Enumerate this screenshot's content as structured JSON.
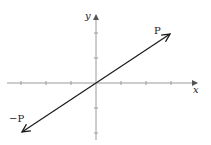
{
  "diagram": {
    "type": "vector-plot",
    "axes": {
      "x_label": "x",
      "y_label": "y",
      "origin_px": [
        96,
        83
      ],
      "tick_spacing_px": 25,
      "x_ticks": [
        -3,
        -2,
        -1,
        1,
        2,
        3
      ],
      "y_ticks": [
        -2,
        -1,
        1,
        2
      ]
    },
    "vectors": [
      {
        "name": "P",
        "label": "P",
        "from": [
          0,
          0
        ],
        "to": [
          3,
          2
        ]
      },
      {
        "name": "neg-P",
        "label": "−P",
        "from": [
          0,
          0
        ],
        "to": [
          -3,
          -2
        ]
      }
    ],
    "colors": {
      "axis": "#9a9a9a",
      "vector": "#1a1a1a",
      "background": "#ffffff"
    }
  }
}
